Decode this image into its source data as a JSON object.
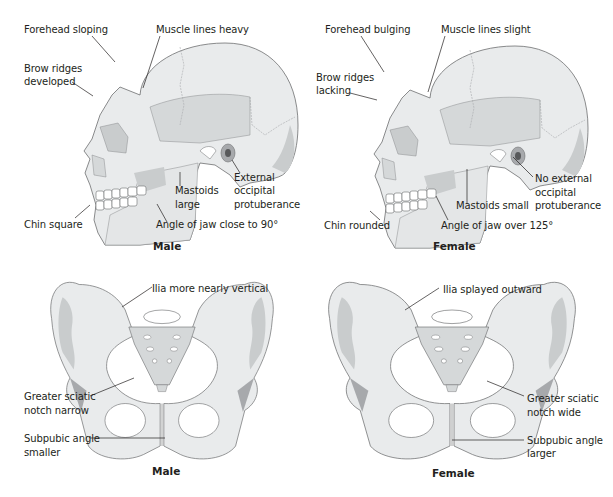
{
  "skulls": {
    "male": {
      "caption": "Male",
      "labels": {
        "forehead": "Forehead sloping",
        "muscle": "Muscle lines heavy",
        "brow_1": "Brow ridges",
        "brow_2": "developed",
        "mastoid_1": "Mastoids",
        "mastoid_2": "large",
        "occipital_1": "External",
        "occipital_2": "occipital",
        "occipital_3": "protuberance",
        "chin": "Chin square",
        "jaw": "Angle of jaw close to 90°"
      }
    },
    "female": {
      "caption": "Female",
      "labels": {
        "forehead": "Forehead bulging",
        "muscle": "Muscle lines slight",
        "brow_1": "Brow ridges",
        "brow_2": "lacking",
        "mastoid": "Mastoids small",
        "occipital_1": "No external",
        "occipital_2": "occipital",
        "occipital_3": "protuberance",
        "chin": "Chin rounded",
        "jaw": "Angle of jaw over 125°"
      }
    }
  },
  "pelves": {
    "male": {
      "caption": "Male",
      "labels": {
        "ilia": "Ilia more nearly vertical",
        "sciatic_1": "Greater sciatic",
        "sciatic_2": "notch narrow",
        "subpubic_1": "Subpubic angle",
        "subpubic_2": "smaller"
      }
    },
    "female": {
      "caption": "Female",
      "labels": {
        "ilia": "Ilia splayed outward",
        "sciatic_1": "Greater sciatic",
        "sciatic_2": "notch wide",
        "subpubic_1": "Subpubic angle",
        "subpubic_2": "larger"
      }
    }
  },
  "colors": {
    "bone": "#e9ebec",
    "shadow": "#c9cccd",
    "outline": "#6d6e70",
    "text": "#231f20"
  }
}
